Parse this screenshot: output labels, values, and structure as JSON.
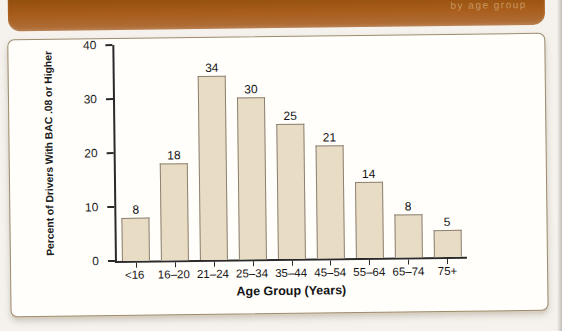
{
  "page": {
    "background": "#f5f2ed"
  },
  "header": {
    "caption_fragment": "by age group",
    "bg": "#a2591c",
    "text_color": "#cfa06b"
  },
  "chart_data": {
    "type": "bar",
    "categories": [
      "<16",
      "16–20",
      "21–24",
      "25–34",
      "35–44",
      "45–54",
      "55–64",
      "65–74",
      "75+"
    ],
    "values": [
      8,
      18,
      34,
      30,
      25,
      21,
      14,
      8,
      5
    ],
    "value_labels": [
      "8",
      "18",
      "34",
      "30",
      "25",
      "21",
      "14",
      "8",
      "5"
    ],
    "xlabel": "Age Group (Years)",
    "ylabel": "Percent of Drivers With BAC .08 or Higher",
    "ylim": [
      0,
      40
    ],
    "yticks": [
      0,
      10,
      20,
      30,
      40
    ],
    "grid": false,
    "legend": "none",
    "bar_fill": "#e8dcc5",
    "bar_border": "#8d8272",
    "axis_color": "#2a2a2a"
  }
}
